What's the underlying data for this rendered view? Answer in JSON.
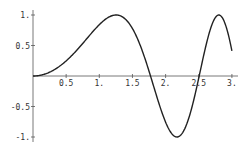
{
  "chart_data": {
    "type": "line",
    "title": "",
    "xlabel": "",
    "ylabel": "",
    "function": "sin(x^2)",
    "xlim": [
      0,
      3
    ],
    "ylim": [
      -1,
      1
    ],
    "grid": false,
    "legend": null,
    "x_ticks": [
      {
        "value": 0.5,
        "label": "0.5"
      },
      {
        "value": 1.0,
        "label": "1."
      },
      {
        "value": 1.5,
        "label": "1.5"
      },
      {
        "value": 2.0,
        "label": "2."
      },
      {
        "value": 2.5,
        "label": "2.5"
      },
      {
        "value": 3.0,
        "label": "3."
      }
    ],
    "y_ticks": [
      {
        "value": 1.0,
        "label": "1."
      },
      {
        "value": 0.5,
        "label": "0.5"
      },
      {
        "value": -0.5,
        "label": "-0.5"
      },
      {
        "value": -1.0,
        "label": "-1."
      }
    ],
    "series": [
      {
        "name": "sin(x^2)",
        "color": "#222222",
        "x": [
          0,
          0.25,
          0.5,
          0.75,
          1.0,
          1.1,
          1.2,
          1.25,
          1.3,
          1.4,
          1.5,
          1.6,
          1.7,
          1.77,
          1.8,
          1.9,
          2.0,
          2.1,
          2.17,
          2.2,
          2.3,
          2.4,
          2.5,
          2.507,
          2.6,
          2.7,
          2.8,
          2.9,
          3.0
        ],
        "values": [
          0,
          0.062,
          0.247,
          0.533,
          0.841,
          0.936,
          0.991,
          1.0,
          0.993,
          0.925,
          0.778,
          0.549,
          0.249,
          0.0,
          -0.101,
          -0.443,
          -0.757,
          -0.952,
          -1.0,
          -0.993,
          -0.85,
          -0.494,
          -0.033,
          0.0,
          0.451,
          0.848,
          1.0,
          0.853,
          0.412
        ]
      }
    ]
  },
  "layout": {
    "origin_px": [
      33,
      76
    ],
    "x_scale_px_per_unit": 66.3,
    "y_scale_px_per_unit": 61
  }
}
